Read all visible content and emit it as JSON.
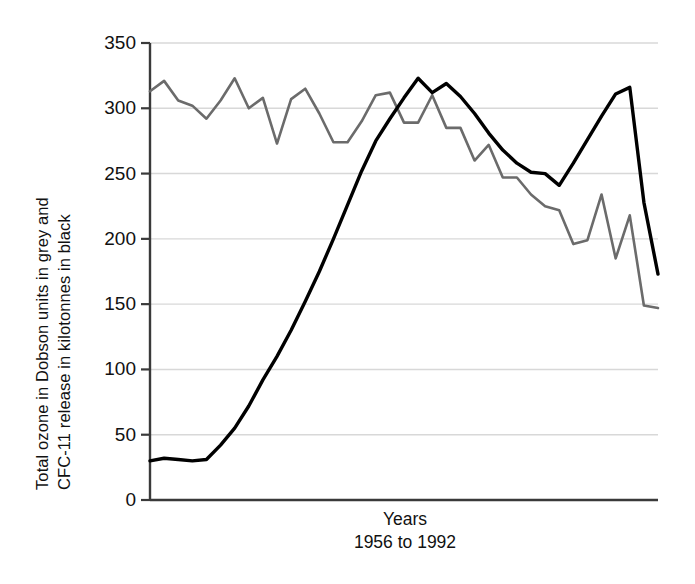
{
  "chart_data": {
    "type": "line",
    "title": "",
    "xlabel": "Years",
    "xlabel_sub": "1956 to 1992",
    "ylabel_line1": "Total ozone in Dobson units in grey and",
    "ylabel_line2": "CFC-11 release in kilotonnes in black",
    "ylim": [
      0,
      350
    ],
    "yticks": [
      350,
      300,
      250,
      200,
      150,
      100,
      50,
      0
    ],
    "ytick_labels": [
      "350",
      "300",
      "250",
      "200",
      "150",
      "100",
      "50",
      "0"
    ],
    "xlim": [
      1956,
      1992
    ],
    "xticks": [],
    "xtick_labels": [],
    "grid": "horizontal",
    "legend": "in-axis-label",
    "colors": {
      "ozone_grey": "#6b6b6b",
      "cfc_black": "#000000",
      "gridline": "#d8d8d8",
      "axis": "#3a3a3a"
    },
    "x": [
      1956,
      1957,
      1958,
      1959,
      1960,
      1961,
      1962,
      1963,
      1964,
      1965,
      1966,
      1967,
      1968,
      1969,
      1970,
      1971,
      1972,
      1973,
      1974,
      1975,
      1976,
      1977,
      1978,
      1979,
      1980,
      1981,
      1982,
      1983,
      1984,
      1985,
      1986,
      1987,
      1988,
      1989,
      1990,
      1991,
      1992
    ],
    "series": [
      {
        "name": "Total ozone in Dobson units",
        "color": "#6b6b6b",
        "style": "grey line",
        "values": [
          313,
          321,
          306,
          302,
          292,
          306,
          323,
          300,
          308,
          273,
          307,
          315,
          296,
          274,
          274,
          290,
          310,
          312,
          289,
          289,
          310,
          285,
          285,
          260,
          272,
          247,
          247,
          234,
          225,
          222,
          196,
          199,
          234,
          185,
          218,
          149,
          147
        ]
      },
      {
        "name": "CFC-11 release in kilotonnes",
        "color": "#000000",
        "style": "black line",
        "values": [
          30,
          32,
          31,
          30,
          31,
          42,
          55,
          72,
          92,
          110,
          130,
          152,
          175,
          200,
          226,
          252,
          275,
          292,
          308,
          323,
          312,
          319,
          309,
          296,
          281,
          268,
          258,
          251,
          250,
          241,
          258,
          276,
          294,
          311,
          316,
          228,
          173
        ]
      }
    ]
  }
}
